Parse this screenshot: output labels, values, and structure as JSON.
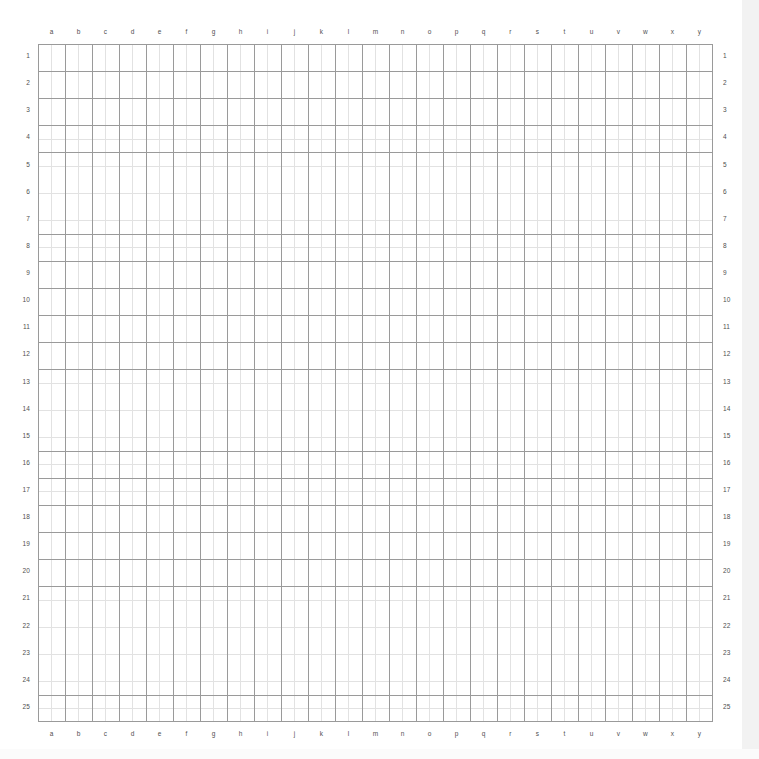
{
  "page": {
    "background_color": "#ffffff",
    "width": 759,
    "height": 759
  },
  "grid": {
    "columns": 25,
    "rows": 25,
    "major_line_color": "#9a9a9a",
    "minor_line_color": "#e2e2e2",
    "label_color": "#4f4f4f",
    "subdivisions_per_cell": 2,
    "origin_x": 38,
    "origin_y": 44,
    "width": 675,
    "height": 678,
    "cell_width": 27,
    "cell_height": 27.12,
    "column_labels": [
      "a",
      "b",
      "c",
      "d",
      "e",
      "f",
      "g",
      "h",
      "i",
      "j",
      "k",
      "l",
      "m",
      "n",
      "o",
      "p",
      "q",
      "r",
      "s",
      "t",
      "u",
      "v",
      "w",
      "x",
      "y"
    ],
    "row_labels": [
      "1",
      "2",
      "3",
      "4",
      "5",
      "6",
      "7",
      "8",
      "9",
      "10",
      "11",
      "12",
      "13",
      "14",
      "15",
      "16",
      "17",
      "18",
      "19",
      "20",
      "21",
      "22",
      "23",
      "24",
      "25"
    ]
  }
}
